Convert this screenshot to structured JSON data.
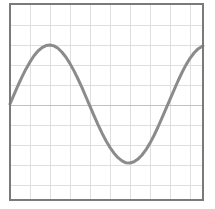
{
  "chart_data": {
    "type": "line",
    "title": "",
    "xlabel": "",
    "ylabel": "",
    "x_tick_labels": [],
    "y_tick_labels": [],
    "legend": null,
    "grid": true,
    "waveform": {
      "shape": "sine",
      "cycles_visible": 1.22,
      "phase_at_left_edge": "zero-crossing-rising",
      "midline_y_px": 104,
      "amplitude_px": 59,
      "period_px": 158,
      "first_peak_px": [
        50,
        45
      ],
      "trough_px": [
        129,
        163
      ],
      "zero_crossing_down_x_px": 89,
      "zero_crossing_up_x_px": 167
    },
    "plot_box_px": {
      "left": 10,
      "top": 4,
      "right": 203,
      "bottom": 200
    },
    "grid_spacing_px": 20,
    "grid_vertical_px": [
      30,
      50,
      70,
      90,
      110,
      130,
      150,
      170,
      190
    ],
    "grid_horizontal_px": [
      25,
      45,
      65,
      85,
      125,
      145,
      165,
      185
    ],
    "axis_y_px": 105,
    "points_px": [
      [
        10,
        104.0
      ],
      [
        14,
        94.7
      ],
      [
        18,
        85.5
      ],
      [
        22,
        76.9
      ],
      [
        26,
        68.9
      ],
      [
        30,
        61.9
      ],
      [
        34,
        55.8
      ],
      [
        38,
        51.0
      ],
      [
        42,
        47.6
      ],
      [
        46,
        45.6
      ],
      [
        50,
        45.0
      ],
      [
        54,
        45.9
      ],
      [
        58,
        48.3
      ],
      [
        62,
        52.2
      ],
      [
        66,
        57.3
      ],
      [
        70,
        63.6
      ],
      [
        74,
        70.9
      ],
      [
        78,
        79.0
      ],
      [
        82,
        87.7
      ],
      [
        86,
        97.0
      ],
      [
        90,
        106.3
      ],
      [
        94,
        115.7
      ],
      [
        98,
        124.7
      ],
      [
        102,
        133.1
      ],
      [
        106,
        140.7
      ],
      [
        110,
        147.5
      ],
      [
        114,
        153.2
      ],
      [
        118,
        157.7
      ],
      [
        122,
        160.9
      ],
      [
        126,
        162.8
      ],
      [
        130,
        163.0
      ],
      [
        134,
        161.8
      ],
      [
        138,
        159.1
      ],
      [
        142,
        155.0
      ],
      [
        146,
        149.7
      ],
      [
        150,
        143.1
      ],
      [
        154,
        135.5
      ],
      [
        158,
        127.0
      ],
      [
        162,
        117.9
      ],
      [
        166,
        108.7
      ],
      [
        170,
        99.3
      ],
      [
        174,
        90.1
      ],
      [
        178,
        81.0
      ],
      [
        182,
        72.5
      ],
      [
        186,
        64.9
      ],
      [
        190,
        58.3
      ],
      [
        194,
        53.0
      ],
      [
        198,
        48.9
      ],
      [
        203,
        45.8
      ]
    ]
  },
  "style": {
    "background": "#ffffff",
    "plot_background": "#ffffff",
    "grid_color": "#dfdfdf",
    "axis_line_color": "#c2c2c2",
    "curve_color": "#8b8b8b",
    "curve_width": 3,
    "border_color": "#7a7a7a",
    "border_width": 2
  },
  "canvas": {
    "width": 215,
    "height": 209
  }
}
